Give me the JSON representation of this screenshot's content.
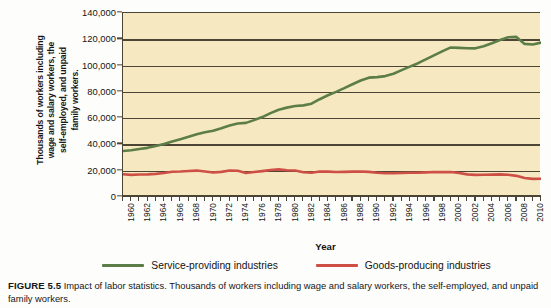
{
  "figure": {
    "number_label": "FIGURE 5.5",
    "caption": "Impact of labor statistics. Thousands of workers including wage and salary workers, the self-employed, and unpaid family workers."
  },
  "axes": {
    "y_title_lines": [
      "Thousands of workers including",
      "wage and salary workers, the",
      "self-employed, and unpaid",
      "family workers."
    ],
    "y_ticks": [
      "0",
      "20,000",
      "40,000",
      "60,000",
      "80,000",
      "100,000",
      "120,000",
      "140,000"
    ],
    "x_title": "Year"
  },
  "legend": {
    "items": [
      {
        "label": "Service-providing industries",
        "color": "#5d7d48"
      },
      {
        "label": "Goods-producing industries",
        "color": "#cd4f46"
      }
    ]
  },
  "colors": {
    "plot_background": "#f6e9c2",
    "axis": "#4c4435",
    "service_line": "#5d7d48",
    "goods_line": "#cd4f46",
    "page_background": "#fdfdfb"
  },
  "chart_data": {
    "type": "line",
    "title": "",
    "xlabel": "Year",
    "ylabel": "Thousands of workers including wage and salary workers, the self-employed, and unpaid family workers.",
    "xlim": [
      1960,
      2011
    ],
    "ylim": [
      0,
      140000
    ],
    "ytick_values": [
      0,
      20000,
      40000,
      60000,
      80000,
      100000,
      120000,
      140000
    ],
    "xtick_labels": [
      "1960",
      "1962",
      "1964",
      "1966",
      "1968",
      "1970",
      "1972",
      "1974",
      "1976",
      "1978",
      "1980",
      "1982",
      "1984",
      "1986",
      "1988",
      "1990",
      "1992",
      "1994",
      "1996",
      "1998",
      "2000",
      "2002",
      "2004",
      "2006",
      "2008",
      "2010"
    ],
    "grid": true,
    "legend_position": "bottom",
    "x": [
      1960,
      1961,
      1962,
      1963,
      1964,
      1965,
      1966,
      1967,
      1968,
      1969,
      1970,
      1971,
      1972,
      1973,
      1974,
      1975,
      1976,
      1977,
      1978,
      1979,
      1980,
      1981,
      1982,
      1983,
      1984,
      1985,
      1986,
      1987,
      1988,
      1989,
      1990,
      1991,
      1992,
      1993,
      1994,
      1995,
      1996,
      1997,
      1998,
      1999,
      2000,
      2001,
      2002,
      2003,
      2004,
      2005,
      2006,
      2007,
      2008,
      2009,
      2010,
      2011
    ],
    "series": [
      {
        "name": "Service-providing industries",
        "color": "#5d7d48",
        "values": [
          35000,
          35600,
          36500,
          37400,
          38800,
          40300,
          42300,
          44000,
          45800,
          47800,
          49300,
          50400,
          52300,
          54400,
          55900,
          56400,
          58500,
          60800,
          63800,
          66400,
          68000,
          69200,
          69700,
          71000,
          74400,
          77400,
          80000,
          82800,
          85800,
          88600,
          90800,
          91200,
          92000,
          93800,
          96500,
          99200,
          101800,
          104900,
          108000,
          111000,
          113800,
          113500,
          113200,
          113100,
          114700,
          117000,
          119500,
          121500,
          121800,
          116500,
          116000,
          117500
        ]
      },
      {
        "name": "Goods-producing industries",
        "color": "#cd4f46",
        "values": [
          17300,
          16800,
          17100,
          17200,
          17600,
          18200,
          19200,
          19400,
          19800,
          20100,
          19400,
          18600,
          19100,
          20200,
          20000,
          18300,
          19000,
          19700,
          20500,
          21000,
          20300,
          20200,
          18800,
          18500,
          19400,
          19300,
          19000,
          19100,
          19300,
          19400,
          19100,
          18400,
          18100,
          18100,
          18300,
          18500,
          18500,
          18700,
          19000,
          18900,
          19000,
          18300,
          17200,
          16800,
          16900,
          17000,
          17200,
          16900,
          16100,
          14400,
          13800,
          13900
        ]
      }
    ]
  }
}
